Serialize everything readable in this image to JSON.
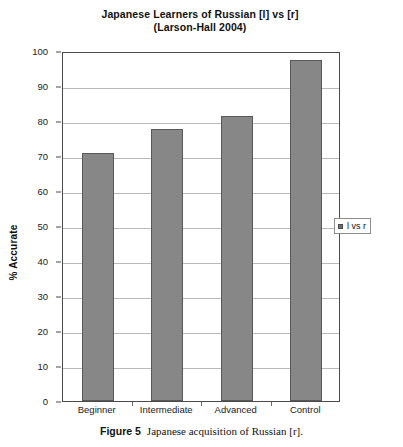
{
  "chart_data": {
    "type": "bar",
    "title": "Japanese Learners of Russian [l] vs [r]",
    "subtitle": "(Larson-Hall 2004)",
    "categories": [
      "Beginner",
      "Intermediate",
      "Advanced",
      "Control"
    ],
    "values": [
      71,
      77.8,
      81.5,
      97.5
    ],
    "series": [
      {
        "name": "l vs r",
        "values": [
          71,
          77.8,
          81.5,
          97.5
        ],
        "color": "#878787"
      }
    ],
    "xlabel": "",
    "ylabel": "% Accurate",
    "ylim": [
      0,
      100
    ],
    "ytick_labels": [
      "0",
      "10",
      "20",
      "30",
      "40",
      "50",
      "60",
      "70",
      "80",
      "90",
      "100"
    ],
    "ytick_values": [
      0,
      10,
      20,
      30,
      40,
      50,
      60,
      70,
      80,
      90,
      100
    ],
    "grid": true,
    "legend_position": "right",
    "legend_entries": [
      "l vs r"
    ]
  },
  "caption": {
    "figure_number": "Figure 5",
    "text": "Japanese acquisition of Russian [r]."
  }
}
